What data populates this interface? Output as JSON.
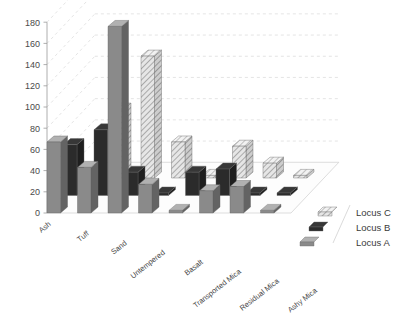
{
  "chart_data": {
    "type": "bar",
    "title": "",
    "subtitle": "",
    "xlabel": "",
    "ylabel": "",
    "ylim": [
      0,
      180
    ],
    "ytick_step": 20,
    "yticks": [
      0,
      20,
      40,
      60,
      80,
      100,
      120,
      140,
      160,
      180
    ],
    "grid": true,
    "projection": "3d",
    "legend_position": "right",
    "categories": [
      "Ash",
      "Tuff",
      "Sand",
      "Untempered",
      "Basalt",
      "Transported Mica",
      "Residual Mica",
      "Ashy Mica"
    ],
    "series": [
      {
        "name": "Locus A",
        "fill": "#8a8a8a",
        "pattern": "solid-gray",
        "values": [
          67,
          43,
          176,
          27,
          0,
          21,
          25,
          1
        ]
      },
      {
        "name": "Locus B",
        "fill": "#2b2b2b",
        "pattern": "solid-black",
        "values": [
          48,
          62,
          22,
          1,
          22,
          25,
          2,
          0
        ]
      },
      {
        "name": "Locus C",
        "fill": "#d9d9d9",
        "pattern": "hatched",
        "values": [
          0,
          65,
          115,
          34,
          0,
          30,
          14,
          0
        ]
      }
    ]
  },
  "legend": {
    "entries": [
      {
        "label": "Locus C"
      },
      {
        "label": "Locus B"
      },
      {
        "label": "Locus A"
      }
    ]
  },
  "colors": {
    "locus_a": "#8a8a8a",
    "locus_b": "#2b2b2b",
    "locus_c": "#d9d9d9",
    "grid": "#d8d8d8",
    "axis": "#9a9a9a",
    "text": "#4a4a4a",
    "background": "#ffffff"
  }
}
